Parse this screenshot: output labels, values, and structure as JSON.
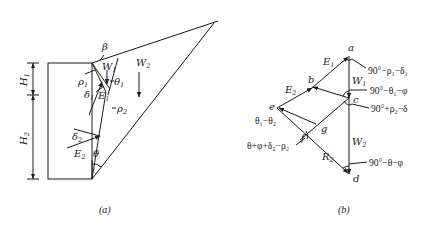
{
  "figure_a": {
    "caption": "(a)",
    "labels": {
      "beta": "β",
      "W1": "W",
      "W1_sub": "1",
      "W2": "W",
      "W2_sub": "2",
      "theta1": "θ",
      "theta1_sub": "1",
      "rho1": "ρ",
      "rho1_sub": "1",
      "rho2": "ρ",
      "rho2_sub": "2",
      "delta1": "δ",
      "delta1_sub": "1",
      "E1": "E",
      "E1_sub": "1",
      "delta2": "δ",
      "delta2_sub": "2",
      "E2": "E",
      "E2_sub": "2",
      "theta": "θ",
      "H1": "H",
      "H1_sub": "1",
      "H2": "H",
      "H2_sub": "2"
    }
  },
  "figure_b": {
    "caption": "(b)",
    "points": {
      "a": "a",
      "b": "b",
      "c": "c",
      "d": "d",
      "e": "e",
      "f": "f",
      "g": "g"
    },
    "labels": {
      "E1": "E",
      "E1_sub": "1",
      "E2": "E",
      "E2_sub": "2",
      "W1": "W",
      "W1_sub": "1",
      "W2": "W",
      "W2_sub": "2",
      "R2": "R",
      "R2_sub": "2"
    },
    "angles": {
      "at_a": "90°−ρ₁−δ₁",
      "at_c_upper": "90°−θ₁−φ",
      "at_c_lower": "90°+ρ₂−δ",
      "at_e": "θ₁−θ₂",
      "at_f": "θ+φ+δ₂−ρ₂",
      "at_d": "90°−θ−φ"
    }
  }
}
